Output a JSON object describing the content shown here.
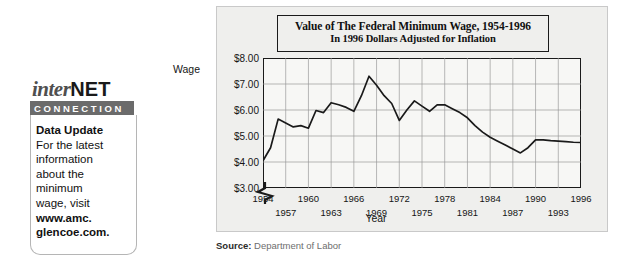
{
  "callout": {
    "logo_inter": "inter",
    "logo_net": "NET",
    "logo_bar": "CONNECTION",
    "heading": "Data Update",
    "lines": [
      "For the latest",
      "information",
      "about the",
      "minimum",
      "wage, visit"
    ],
    "url_line1": "www.amc.",
    "url_line2": "glencoe.com.",
    "mouse_icon": "computer-mouse-icon"
  },
  "figure": {
    "source_prefix": "Source:",
    "source_text": "Department of Labor",
    "axis_break_icon": "axis-break-icon"
  },
  "chart_data": {
    "type": "line",
    "title": "Value of The Federal Minimum Wage, 1954-1996",
    "subtitle": "In 1996 Dollars Adjusted for Inflation",
    "xlabel": "Year",
    "ylabel": "Wage",
    "ylim": [
      3.0,
      8.0
    ],
    "xlim": [
      1954,
      1996
    ],
    "grid": true,
    "legend": null,
    "axis_break_below": 3.0,
    "ytick_labels": [
      "$8.00",
      "$7.00",
      "$6.00",
      "$5.00",
      "$4.00",
      "$3.00"
    ],
    "ytick_values": [
      8.0,
      7.0,
      6.0,
      5.0,
      4.0,
      3.0
    ],
    "xtick_values": [
      1954,
      1957,
      1960,
      1963,
      1966,
      1969,
      1972,
      1975,
      1978,
      1981,
      1984,
      1987,
      1990,
      1993,
      1996
    ],
    "xtick_labels_row1": [
      "1954",
      "1960",
      "1966",
      "1972",
      "1978",
      "1984",
      "1990",
      "1996"
    ],
    "xtick_labels_row2": [
      "1957",
      "1963",
      "1969",
      "1975",
      "1981",
      "1987",
      "1993"
    ],
    "series": [
      {
        "name": "Federal minimum wage in 1996 dollars",
        "color": "#1a1a1a",
        "x": [
          1954,
          1955,
          1956,
          1957,
          1958,
          1959,
          1960,
          1961,
          1962,
          1963,
          1964,
          1965,
          1966,
          1967,
          1968,
          1969,
          1970,
          1971,
          1972,
          1973,
          1974,
          1975,
          1976,
          1977,
          1978,
          1979,
          1980,
          1981,
          1982,
          1983,
          1984,
          1985,
          1986,
          1987,
          1988,
          1989,
          1990,
          1991,
          1992,
          1993,
          1994,
          1995,
          1996
        ],
        "values": [
          4.05,
          4.55,
          5.65,
          5.5,
          5.35,
          5.4,
          5.3,
          5.98,
          5.9,
          6.28,
          6.2,
          6.1,
          5.95,
          6.55,
          7.3,
          6.95,
          6.55,
          6.25,
          5.6,
          6.0,
          6.35,
          6.15,
          5.95,
          6.2,
          6.2,
          6.05,
          5.9,
          5.7,
          5.4,
          5.15,
          4.95,
          4.8,
          4.65,
          4.5,
          4.35,
          4.55,
          4.85,
          4.85,
          4.82,
          4.8,
          4.78,
          4.76,
          4.75
        ]
      }
    ]
  }
}
